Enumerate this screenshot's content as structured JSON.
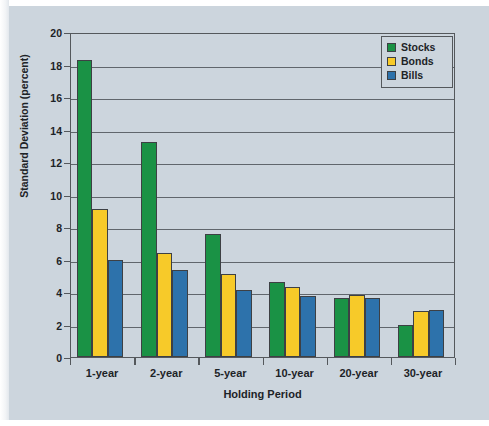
{
  "figure": {
    "background_color": "#ccd5dd",
    "plot_border_color": "#54585c"
  },
  "chart_data": {
    "type": "bar",
    "title": "",
    "subtitle": "",
    "xlabel": "Holding Period",
    "ylabel": "Standard Deviation (percent)",
    "ylim": [
      0,
      20
    ],
    "ytick_step": 2,
    "yticks": [
      "20",
      "18",
      "16",
      "14",
      "12",
      "10",
      "8",
      "6",
      "4",
      "2",
      "0"
    ],
    "grid": "horizontal",
    "legend_position": "top-right",
    "categories": [
      "1-year",
      "2-year",
      "5-year",
      "10-year",
      "20-year",
      "30-year"
    ],
    "series": [
      {
        "name": "Stocks",
        "color": "#1a9245",
        "values": [
          18.3,
          13.25,
          7.6,
          4.6,
          3.65,
          1.95
        ]
      },
      {
        "name": "Bonds",
        "color": "#f7ca29",
        "values": [
          9.1,
          6.4,
          5.1,
          4.3,
          3.8,
          2.85
        ]
      },
      {
        "name": "Bills",
        "color": "#2d72ab",
        "values": [
          6.0,
          5.35,
          4.1,
          3.75,
          3.65,
          2.9
        ]
      }
    ]
  }
}
